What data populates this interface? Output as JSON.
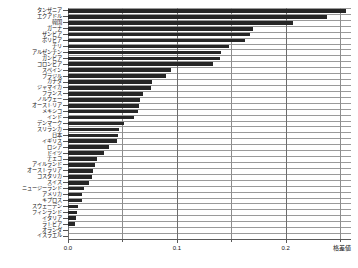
{
  "chart_data": {
    "type": "bar",
    "orientation": "horizontal",
    "title": "",
    "xlabel": "格差値",
    "ylabel": "",
    "xlim": [
      0.0,
      0.26
    ],
    "xticks": [
      0.0,
      0.1,
      0.2
    ],
    "xtick_labels": [
      "0.0",
      "0.1",
      "0.2"
    ],
    "minor_gridlines_x": [
      0.05,
      0.15,
      0.25
    ],
    "grid": true,
    "legend": "none",
    "bar_color": "#262626",
    "categories": [
      "タンザニア",
      "エクアドル",
      "韓国",
      "ガーナ",
      "ザンビア",
      "ボリビア",
      "チリ",
      "アルゼンチン",
      "ガンビア",
      "コロンビア",
      "スペイン",
      "ブラジル",
      "カナダ",
      "ジャマイカ",
      "フランス",
      "ノルウェー",
      "オーストリア",
      "メキシコ",
      "インド",
      "デンマーク",
      "スリランカ",
      "日本",
      "イギリス",
      "ロシア",
      "ドイツ",
      "チェコ",
      "アイルランド",
      "オーストラリア",
      "コスタリカ",
      "スイス",
      "ニュージーランド",
      "アメリカ",
      "キプロス",
      "スウェーデン",
      "フィンランド",
      "イタリア",
      "ラトビア",
      "オランダ",
      "イスラエル"
    ],
    "values": [
      0.255,
      0.238,
      0.207,
      0.17,
      0.167,
      0.163,
      0.148,
      0.141,
      0.14,
      0.133,
      0.095,
      0.09,
      0.077,
      0.076,
      0.069,
      0.066,
      0.065,
      0.064,
      0.061,
      0.051,
      0.047,
      0.046,
      0.045,
      0.038,
      0.033,
      0.027,
      0.025,
      0.023,
      0.022,
      0.019,
      0.015,
      0.013,
      0.013,
      0.009,
      0.008,
      0.007,
      0.006,
      0.0,
      0.0
    ]
  }
}
